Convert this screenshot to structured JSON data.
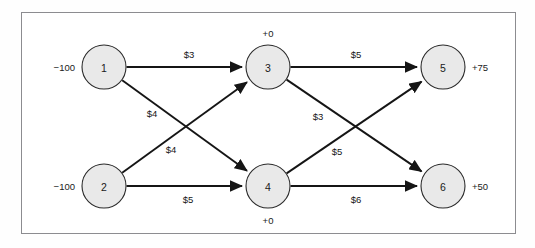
{
  "figure": {
    "kind": "network-flow-diagram",
    "frame": {
      "border_color": "#8c8c90",
      "background": "#ffffff"
    },
    "node_fill": "#e9e9e9",
    "node_stroke": "#2a2a2a",
    "edge_color": "#151515"
  },
  "chart_data": {
    "type": "diagram",
    "title": "",
    "xlabel": "",
    "ylabel": "",
    "nodes": [
      {
        "id": "1",
        "label": "1",
        "supply": "-100",
        "supply_display": "−100",
        "supply_position": "left",
        "cx": 104,
        "cy": 67,
        "r": 22
      },
      {
        "id": "2",
        "label": "2",
        "supply": "-100",
        "supply_display": "−100",
        "supply_position": "left",
        "cx": 104,
        "cy": 186,
        "r": 22
      },
      {
        "id": "3",
        "label": "3",
        "supply": "0",
        "supply_display": "+0",
        "supply_position": "top",
        "cx": 268,
        "cy": 67,
        "r": 22
      },
      {
        "id": "4",
        "label": "4",
        "supply": "0",
        "supply_display": "+0",
        "supply_position": "bottom",
        "cx": 268,
        "cy": 186,
        "r": 22
      },
      {
        "id": "5",
        "label": "5",
        "supply": "75",
        "supply_display": "+75",
        "supply_position": "right",
        "cx": 443,
        "cy": 67,
        "r": 22
      },
      {
        "id": "6",
        "label": "6",
        "supply": "50",
        "supply_display": "+50",
        "supply_position": "right",
        "cx": 443,
        "cy": 186,
        "r": 22
      }
    ],
    "edges": [
      {
        "from": "1",
        "to": "3",
        "cost": 3,
        "cost_display": "$3",
        "lx": 189,
        "ly": 54
      },
      {
        "from": "1",
        "to": "4",
        "cost": 4,
        "cost_display": "$4",
        "lx": 152,
        "ly": 113
      },
      {
        "from": "2",
        "to": "3",
        "cost": 4,
        "cost_display": "$4",
        "lx": 171,
        "ly": 149
      },
      {
        "from": "2",
        "to": "4",
        "cost": 5,
        "cost_display": "$5",
        "lx": 188,
        "ly": 199
      },
      {
        "from": "3",
        "to": "5",
        "cost": 5,
        "cost_display": "$5",
        "lx": 356,
        "ly": 54
      },
      {
        "from": "3",
        "to": "6",
        "cost": 3,
        "cost_display": "$3",
        "lx": 318,
        "ly": 116
      },
      {
        "from": "4",
        "to": "5",
        "cost": 5,
        "cost_display": "$5",
        "lx": 337,
        "ly": 151
      },
      {
        "from": "4",
        "to": "6",
        "cost": 6,
        "cost_display": "$6",
        "lx": 356,
        "ly": 199
      }
    ],
    "legend": [],
    "annotations": [
      "Negative values at nodes 1 and 2 denote supply; positive values at nodes 5 and 6 denote demand; nodes 3 and 4 are transshipment nodes with +0."
    ]
  }
}
